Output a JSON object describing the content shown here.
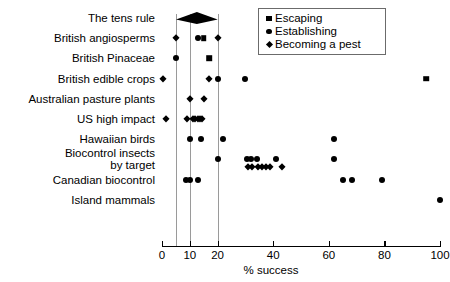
{
  "chart_data": {
    "type": "scatter",
    "title": "",
    "xlabel": "% success",
    "ylabel": "",
    "xlim": [
      0,
      100
    ],
    "xticks": [
      0,
      10,
      20,
      40,
      60,
      80,
      100
    ],
    "xtick_labels": [
      "0",
      "10",
      "20",
      "40",
      "60",
      "80",
      "100"
    ],
    "grid": false,
    "reference_lines": [
      5,
      10,
      20
    ],
    "legend_position": "top-right",
    "legend": [
      {
        "label": "Escaping",
        "marker": "square"
      },
      {
        "label": "Establishing",
        "marker": "circle"
      },
      {
        "label": "Becoming a pest",
        "marker": "diamond"
      }
    ],
    "categories": [
      "The tens rule",
      "British angiosperms",
      "British Pinaceae",
      "British edible crops",
      "Australian pasture plants",
      "US high impact",
      "Hawaiian birds",
      "Biocontrol insects\nby target",
      "Canadian biocontrol",
      "Island mammals"
    ],
    "series": [
      {
        "name": "Escaping",
        "marker": "square",
        "points": [
          {
            "category": "British angiosperms",
            "value": 15
          },
          {
            "category": "British Pinaceae",
            "value": 17
          },
          {
            "category": "British edible crops",
            "value": 95
          }
        ]
      },
      {
        "name": "Establishing",
        "marker": "circle",
        "points": [
          {
            "category": "British angiosperms",
            "value": 13
          },
          {
            "category": "British Pinaceae",
            "value": 5
          },
          {
            "category": "British edible crops",
            "value": 20
          },
          {
            "category": "British edible crops",
            "value": 30
          },
          {
            "category": "Hawaiian birds",
            "value": 10
          },
          {
            "category": "Hawaiian birds",
            "value": 14
          },
          {
            "category": "Hawaiian birds",
            "value": 22
          },
          {
            "category": "Hawaiian birds",
            "value": 62
          },
          {
            "category": "Biocontrol insects\nby target",
            "value": 20
          },
          {
            "category": "Biocontrol insects\nby target",
            "value": 30.5
          },
          {
            "category": "Biocontrol insects\nby target",
            "value": 32
          },
          {
            "category": "Biocontrol insects\nby target",
            "value": 34
          },
          {
            "category": "Biocontrol insects\nby target",
            "value": 41
          },
          {
            "category": "Biocontrol insects\nby target",
            "value": 62
          },
          {
            "category": "Canadian biocontrol",
            "value": 8.5
          },
          {
            "category": "Canadian biocontrol",
            "value": 10
          },
          {
            "category": "Canadian biocontrol",
            "value": 13
          },
          {
            "category": "Canadian biocontrol",
            "value": 65
          },
          {
            "category": "Canadian biocontrol",
            "value": 68.5
          },
          {
            "category": "Canadian biocontrol",
            "value": 79
          },
          {
            "category": "Island mammals",
            "value": 100
          }
        ]
      },
      {
        "name": "Becoming a pest",
        "marker": "diamond",
        "points": [
          {
            "category": "British angiosperms",
            "value": 5
          },
          {
            "category": "British angiosperms",
            "value": 20
          },
          {
            "category": "British edible crops",
            "value": 0.5
          },
          {
            "category": "British edible crops",
            "value": 17
          },
          {
            "category": "Australian pasture plants",
            "value": 10
          },
          {
            "category": "Australian pasture plants",
            "value": 15
          },
          {
            "category": "US high impact",
            "value": 1.5
          },
          {
            "category": "US high impact",
            "value": 9
          },
          {
            "category": "US high impact",
            "value": 11
          },
          {
            "category": "US high impact",
            "value": 12
          },
          {
            "category": "US high impact",
            "value": 12.8
          },
          {
            "category": "US high impact",
            "value": 13.6
          },
          {
            "category": "US high impact",
            "value": 14.4
          },
          {
            "category": "Biocontrol insects\nby target",
            "value": 31
          },
          {
            "category": "Biocontrol insects\nby target",
            "value": 32.5
          },
          {
            "category": "Biocontrol insects\nby target",
            "value": 34.5
          },
          {
            "category": "Biocontrol insects\nby target",
            "value": 36
          },
          {
            "category": "Biocontrol insects\nby target",
            "value": 37.5
          },
          {
            "category": "Biocontrol insects\nby target",
            "value": 39
          },
          {
            "category": "Biocontrol insects\nby target",
            "value": 43
          }
        ]
      }
    ],
    "tens_rule_band": {
      "start": 5,
      "end": 20,
      "category": "The tens rule"
    },
    "colors": {
      "marker": "#000000",
      "reference_line": "#9a9a9a",
      "axis": "#000000"
    }
  }
}
